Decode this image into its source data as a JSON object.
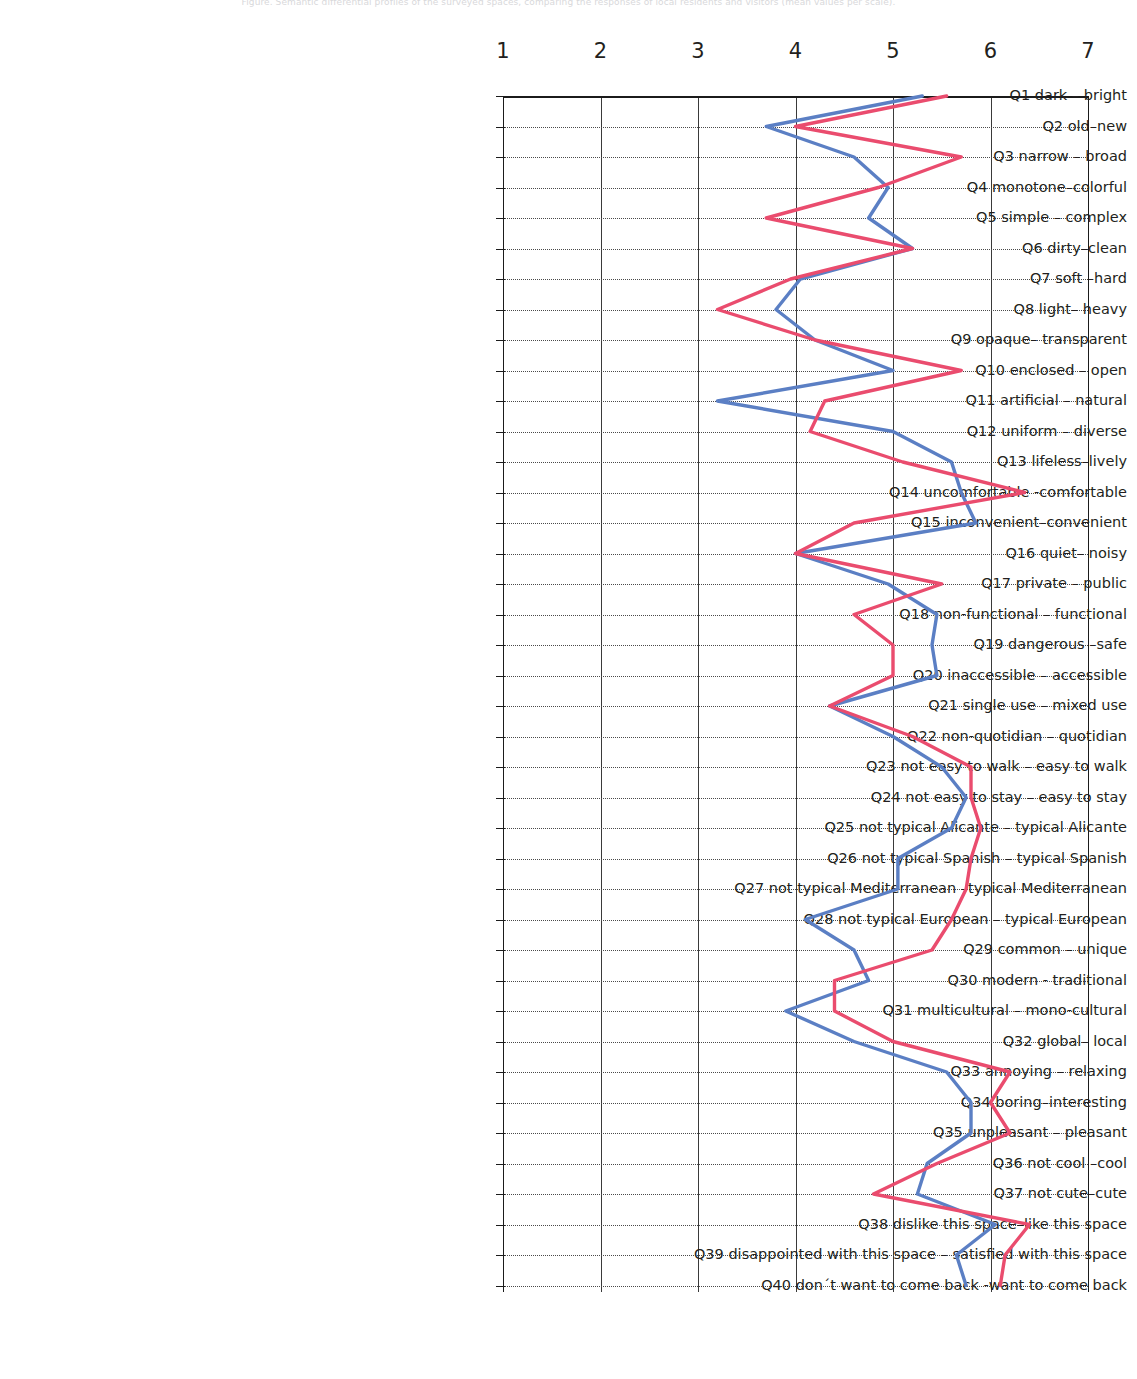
{
  "top_caption": "Figure. Semantic differential profiles of the surveyed spaces, comparing the responses of local residents and visitors (mean values per scale).",
  "chart_data": {
    "type": "line",
    "orientation": "horizontal",
    "title": "",
    "xlabel": "",
    "ylabel": "",
    "xlim": [
      1,
      7
    ],
    "xticks": [
      1,
      2,
      3,
      4,
      5,
      6,
      7
    ],
    "xtick_labels": [
      "1",
      "2",
      "3",
      "4",
      "5",
      "6",
      "7"
    ],
    "grid": true,
    "legend": "none",
    "categories": [
      "Q1 dark – bright",
      "Q2 old–new",
      "Q3 narrow – broad",
      "Q4 monotone–colorful",
      "Q5 simple – complex",
      "Q6 dirty–clean",
      "Q7 soft –hard",
      "Q8 light– heavy",
      "Q9 opaque– transparent",
      "Q10 enclosed – open",
      "Q11 artificial – natural",
      "Q12 uniform – diverse",
      "Q13 lifeless–lively",
      "Q14 uncomfortable -comfortable",
      "Q15 inconvenient–convenient",
      "Q16 quiet– noisy",
      "Q17 private – public",
      "Q18 non-functional – functional",
      "Q19 dangerous –safe",
      "Q20 inaccessible – accessible",
      "Q21 single use – mixed use",
      "Q22 non-quotidian – quotidian",
      "Q23 not easy to walk – easy to walk",
      "Q24 not easy to stay – easy to stay",
      "Q25 not typical Alicante – typical Alicante",
      "Q26 not typical Spanish – typical Spanish",
      "Q27 not typical Mediterranean –typical Mediterranean",
      "Q28 not typical European – typical European",
      "Q29 common – unique",
      "Q30 modern - traditional",
      "Q31 multicultural – mono-cultural",
      "Q32 global– local",
      "Q33 annoying – relaxing",
      "Q34 boring–interesting",
      "Q35 unpleasant – pleasant",
      "Q36 not cool –cool",
      "Q37 not cute–cute",
      "Q38 dislike this space–like this space",
      "Q39 disappointed with this space – satisfied with this space",
      "Q40 don´t want to come back -want to come back"
    ],
    "series": [
      {
        "name": "series-blue",
        "color": "#5b7fc4",
        "values": [
          5.3,
          3.7,
          4.6,
          4.95,
          4.75,
          5.2,
          4.05,
          3.8,
          4.2,
          5.0,
          3.2,
          5.0,
          5.6,
          5.7,
          5.85,
          4.0,
          4.95,
          5.45,
          5.4,
          5.45,
          4.35,
          5.0,
          5.5,
          5.75,
          5.6,
          5.05,
          5.05,
          4.1,
          4.6,
          4.75,
          3.9,
          4.6,
          5.55,
          5.8,
          5.8,
          5.35,
          5.25,
          6.05,
          5.65,
          5.75
        ]
      },
      {
        "name": "series-red",
        "color": "#ea4c6e",
        "values": [
          5.55,
          4.0,
          5.7,
          4.85,
          3.7,
          5.2,
          3.95,
          3.2,
          4.2,
          5.7,
          4.3,
          4.15,
          5.1,
          6.35,
          4.6,
          4.0,
          5.5,
          4.6,
          5.0,
          5.0,
          4.35,
          5.2,
          5.8,
          5.8,
          5.9,
          5.8,
          5.75,
          5.6,
          5.4,
          4.4,
          4.4,
          5.0,
          6.2,
          6.0,
          6.2,
          5.45,
          4.8,
          6.4,
          6.15,
          6.1
        ]
      }
    ]
  }
}
